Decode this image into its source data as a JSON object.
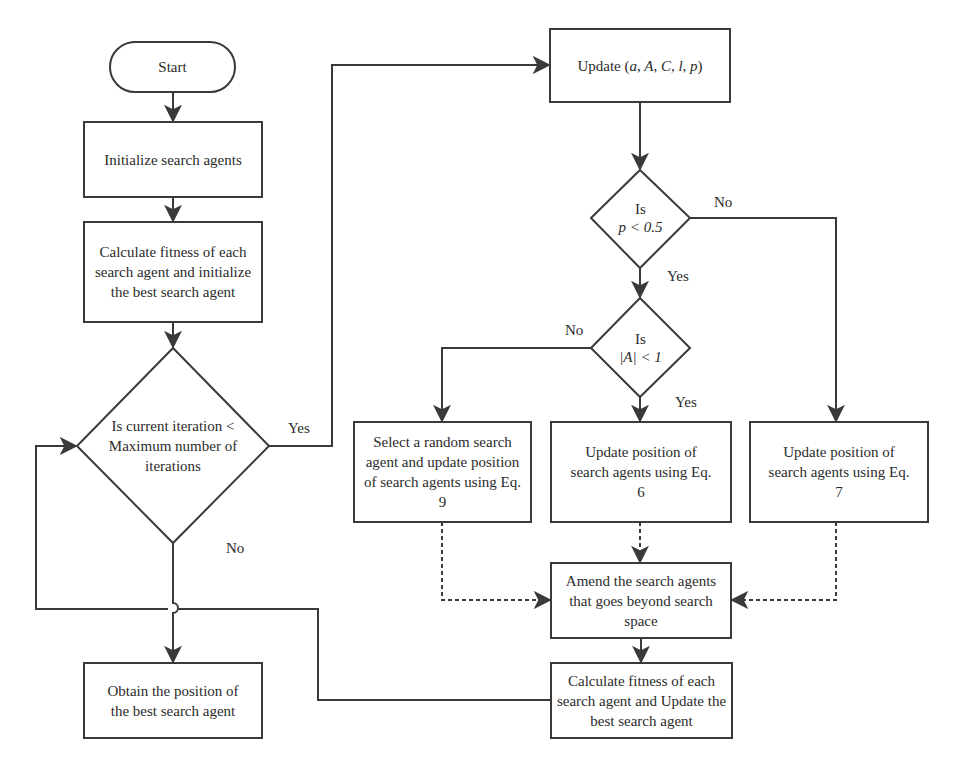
{
  "diagram": {
    "type": "flowchart",
    "colors": {
      "stroke": "#3a3a3a",
      "text": "#2b2b2b",
      "background": "#ffffff"
    },
    "nodes": {
      "start": {
        "shape": "terminal",
        "label": "Start"
      },
      "init": {
        "shape": "process",
        "label": "Initialize search agents"
      },
      "calc_init": {
        "shape": "process",
        "label": "Calculate fitness of each search agent and initialize the best search agent"
      },
      "iter_check": {
        "shape": "decision",
        "label": "Is current iteration < Maximum number of iterations"
      },
      "update_params": {
        "shape": "process",
        "label_prefix": "Update (",
        "label_vars": "a, A, C, l, p",
        "label_suffix": ")"
      },
      "p_check": {
        "shape": "decision",
        "line1": "Is",
        "line2": "p < 0.5"
      },
      "a_check": {
        "shape": "decision",
        "line1": "Is",
        "line2": "|A| < 1"
      },
      "random_update": {
        "shape": "process",
        "label": "Select a random search agent and update position of search agents using Eq. 9"
      },
      "eq6_update": {
        "shape": "process",
        "label": "Update position of search agents using Eq. 6"
      },
      "eq7_update": {
        "shape": "process",
        "label": "Update position of search agents using Eq. 7"
      },
      "amend": {
        "shape": "process",
        "label": "Amend the search agents that goes beyond search space"
      },
      "calc_update": {
        "shape": "process",
        "label": "Calculate fitness of each search agent and Update the best search agent"
      },
      "obtain": {
        "shape": "process",
        "label": "Obtain the position of the best search agent"
      }
    },
    "edge_labels": {
      "iter_yes": "Yes",
      "iter_no": "No",
      "p_no": "No",
      "p_yes": "Yes",
      "a_no": "No",
      "a_yes": "Yes"
    },
    "edges": [
      {
        "from": "start",
        "to": "init",
        "style": "solid"
      },
      {
        "from": "init",
        "to": "calc_init",
        "style": "solid"
      },
      {
        "from": "calc_init",
        "to": "iter_check",
        "style": "solid"
      },
      {
        "from": "iter_check",
        "to": "update_params",
        "label": "Yes",
        "style": "solid"
      },
      {
        "from": "iter_check",
        "to": "obtain",
        "label": "No",
        "style": "solid"
      },
      {
        "from": "update_params",
        "to": "p_check",
        "style": "solid"
      },
      {
        "from": "p_check",
        "to": "eq7_update",
        "label": "No",
        "style": "solid"
      },
      {
        "from": "p_check",
        "to": "a_check",
        "label": "Yes",
        "style": "solid"
      },
      {
        "from": "a_check",
        "to": "random_update",
        "label": "No",
        "style": "solid"
      },
      {
        "from": "a_check",
        "to": "eq6_update",
        "label": "Yes",
        "style": "solid"
      },
      {
        "from": "random_update",
        "to": "amend",
        "style": "dashed"
      },
      {
        "from": "eq6_update",
        "to": "amend",
        "style": "dashed"
      },
      {
        "from": "eq7_update",
        "to": "amend",
        "style": "dashed"
      },
      {
        "from": "amend",
        "to": "calc_update",
        "style": "solid"
      },
      {
        "from": "calc_update",
        "to": "iter_check",
        "style": "solid"
      }
    ]
  }
}
